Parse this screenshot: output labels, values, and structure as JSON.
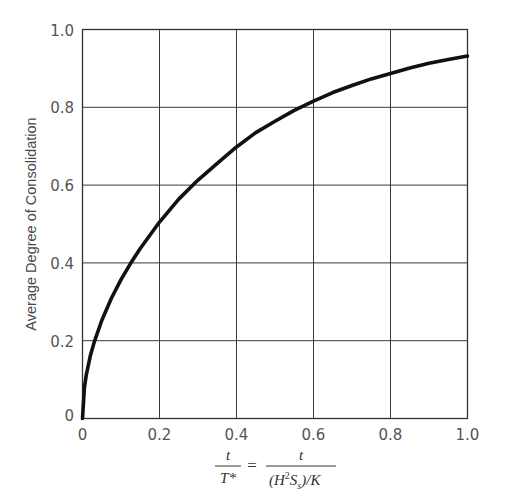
{
  "chart_data": {
    "type": "line",
    "title": "",
    "xlabel": "t/T* = t/((H^2 S_s)/K)",
    "ylabel": "Average Degree of Consolidation",
    "xlim": [
      0,
      1.0
    ],
    "ylim": [
      0,
      1.0
    ],
    "grid": true,
    "legend": null,
    "x_ticks": [
      "0",
      "0.2",
      "0.4",
      "0.6",
      "0.8",
      "1.0"
    ],
    "y_ticks": [
      "0",
      "0.2",
      "0.4",
      "0.6",
      "0.8",
      "1.0"
    ],
    "series": [
      {
        "name": "Average Degree of Consolidation",
        "color": "#111111",
        "x": [
          0,
          0.005,
          0.01,
          0.02,
          0.03,
          0.05,
          0.075,
          0.1,
          0.125,
          0.15,
          0.2,
          0.25,
          0.3,
          0.35,
          0.4,
          0.45,
          0.5,
          0.55,
          0.6,
          0.65,
          0.7,
          0.75,
          0.8,
          0.85,
          0.9,
          0.95,
          1.0
        ],
        "y": [
          0,
          0.08,
          0.113,
          0.16,
          0.195,
          0.252,
          0.309,
          0.357,
          0.399,
          0.437,
          0.505,
          0.564,
          0.613,
          0.656,
          0.698,
          0.735,
          0.764,
          0.792,
          0.816,
          0.838,
          0.856,
          0.873,
          0.887,
          0.901,
          0.913,
          0.923,
          0.932
        ]
      }
    ]
  },
  "axes": {
    "y_label": "Average Degree of Consolidation",
    "x_label": {
      "lhs_numerator": "t",
      "lhs_denominator": "T*",
      "equals": "=",
      "rhs_numerator": "t",
      "rhs_denominator_parts": [
        "(H",
        "2",
        "S",
        "s",
        ")/K"
      ]
    }
  }
}
